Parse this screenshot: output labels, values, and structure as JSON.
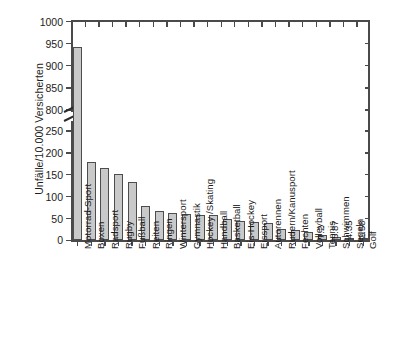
{
  "chart_data": {
    "type": "bar",
    "title": "",
    "xlabel": "",
    "ylabel": "Unfälle/10.000 Versicherten",
    "ylim": [
      0,
      1000
    ],
    "axis_break": {
      "present": true,
      "lower_max": 250,
      "upper_min": 800
    },
    "grid": false,
    "legend": null,
    "ytick_labels": [
      "1000",
      "950",
      "900",
      "850",
      "800",
      "250",
      "200",
      "150",
      "100",
      "50",
      "0"
    ],
    "ytick_values": [
      1000,
      950,
      900,
      850,
      800,
      250,
      200,
      150,
      100,
      50,
      0
    ],
    "categories": [
      "Motorrad-Sport",
      "Boxen",
      "Radsport",
      "Rugby",
      "Fußball",
      "Reiten",
      "Ringen",
      "Wintersport",
      "Gymnastik",
      "Hockey /Skating",
      "Handball",
      "Basketball",
      "Eis-Hockey",
      "Eissport",
      "Autorennen",
      "Rudern/Kanusport",
      "Fechten",
      "Volleyball",
      "Tennis",
      "Schwimmen",
      "Segeln",
      "Golf"
    ],
    "values": [
      942,
      180,
      166,
      152,
      133,
      78,
      68,
      62,
      60,
      59,
      57,
      50,
      44,
      41,
      40,
      26,
      24,
      20,
      12,
      7.2,
      5.87,
      4.35
    ],
    "point_labels": [
      {
        "category": "Tennis",
        "label": "7.2"
      },
      {
        "category": "Schwimmen",
        "label": "5.87"
      },
      {
        "category": "Segeln",
        "label": "4.35"
      },
      {
        "category": "Golf",
        "label": "2.58"
      }
    ],
    "bar_fill_color": "#c9c9c9",
    "bar_edge_color": "#4d4d4d",
    "axis_color": "#4a4a4a"
  }
}
